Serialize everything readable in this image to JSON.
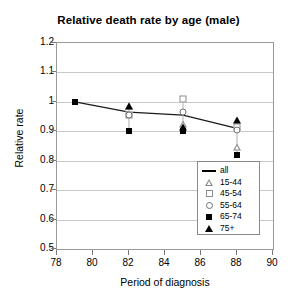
{
  "chart_data": {
    "type": "line",
    "title": "Relative death rate by age (male)",
    "xlabel": "Period of diagnosis",
    "ylabel": "Relative rate",
    "xlim": [
      78,
      90
    ],
    "ylim": [
      0.5,
      1.2
    ],
    "xticks": [
      "78",
      "80",
      "82",
      "84",
      "86",
      "88",
      "90"
    ],
    "yticks": [
      "1.2",
      "1.1",
      "1",
      "0.9",
      "0.8",
      "0.7",
      "0.6",
      "0.5"
    ],
    "grid": "horizontal",
    "legend_position": "inside-lower-right",
    "x": [
      79,
      82,
      85,
      88
    ],
    "series": [
      {
        "name": "all",
        "marker": "line",
        "values": [
          1.0,
          0.965,
          0.955,
          0.91
        ]
      },
      {
        "name": "15-44",
        "marker": "open-triangle",
        "values": [
          null,
          0.985,
          0.925,
          0.845
        ]
      },
      {
        "name": "45-54",
        "marker": "open-square",
        "values": [
          null,
          0.955,
          1.01,
          0.915
        ]
      },
      {
        "name": "55-64",
        "marker": "open-circle",
        "values": [
          null,
          0.955,
          0.965,
          0.905
        ]
      },
      {
        "name": "65-74",
        "marker": "filled-square",
        "values": [
          1.0,
          0.9,
          0.9,
          0.82
        ]
      },
      {
        "name": "75+",
        "marker": "filled-triangle",
        "values": [
          null,
          0.985,
          0.915,
          0.94
        ]
      }
    ]
  },
  "legend": {
    "entries": [
      {
        "label": "all",
        "key": "line-key-icon"
      },
      {
        "label": "15-44",
        "key": "open-triangle-icon"
      },
      {
        "label": "45-54",
        "key": "open-square-icon"
      },
      {
        "label": "55-64",
        "key": "open-circle-icon"
      },
      {
        "label": "65-74",
        "key": "filled-square-icon"
      },
      {
        "label": "75+",
        "key": "filled-triangle-icon"
      }
    ]
  }
}
